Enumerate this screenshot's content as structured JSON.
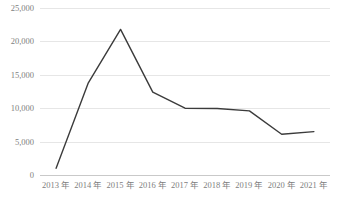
{
  "chart_data": {
    "type": "line",
    "title": "",
    "subtitle": "",
    "xlabel": "",
    "ylabel": "",
    "categories": [
      "2013 年",
      "2014 年",
      "2015 年",
      "2016 年",
      "2017 年",
      "2018 年",
      "2019 年",
      "2020 年",
      "2021 年"
    ],
    "values": [
      1000,
      13800,
      21800,
      12400,
      10000,
      9950,
      9600,
      6100,
      6500
    ],
    "series": [
      {
        "name": "",
        "values": [
          1000,
          13800,
          21800,
          12400,
          10000,
          9950,
          9600,
          6100,
          6500
        ]
      }
    ],
    "ylim": [
      0,
      25000
    ],
    "yticks": [
      0,
      5000,
      10000,
      15000,
      20000,
      25000
    ],
    "ytick_labels": [
      "0",
      "5,000",
      "10,000",
      "15,000",
      "20,000",
      "25,000"
    ],
    "grid": true,
    "grid_axis": "y",
    "legend": false,
    "legend_position": "none",
    "markers": false,
    "annotations": []
  },
  "style": {
    "line_color": "#3b3b3b",
    "grid_color": "#e6e6e6",
    "axis_color": "#c9c9c9",
    "tick_label_color": "#808080",
    "background": "#ffffff"
  }
}
